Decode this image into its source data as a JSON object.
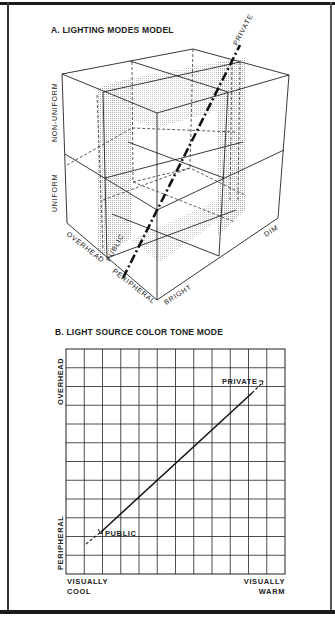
{
  "panel_a": {
    "title": "A. LIGHTING MODES MODEL",
    "axis_labels": {
      "vertical_upper": "NON-UNIFORM",
      "vertical_lower": "UNIFORM",
      "left_depth_back": "OVERHEAD",
      "left_depth_front": "PERIPHERAL",
      "right_near": "BRIGHT",
      "right_far": "DIM"
    },
    "trajectory": {
      "start_label": "PUBLIC",
      "end_label": "PRIVATE"
    }
  },
  "panel_b": {
    "title": "B. LIGHT SOURCE COLOR TONE MODE",
    "y_label_top": "OVERHEAD",
    "y_label_bottom": "PERIPHERAL",
    "x_label_left_1": "VISUALLY",
    "x_label_left_2": "COOL",
    "x_label_right_1": "VISUALLY",
    "x_label_right_2": "WARM",
    "point_start_label": "PUBLIC",
    "point_end_label": "PRIVATE"
  },
  "chart_data": [
    {
      "type": "diagram",
      "title": "A. LIGHTING MODES MODEL",
      "description": "3D isometric 2x2x2 cube model; axes: Uniform/Non-uniform (vertical), Overhead/Peripheral (left depth), Bright/Dim (right depth). Dash-dot trajectory from PUBLIC (bottom, bright/peripheral side) to PRIVATE (top, non-uniform/dim/overhead).",
      "axes": {
        "vertical": [
          "UNIFORM",
          "NON-UNIFORM"
        ],
        "left": [
          "PERIPHERAL",
          "OVERHEAD"
        ],
        "right": [
          "BRIGHT",
          "DIM"
        ]
      },
      "annotations": [
        "PUBLIC",
        "PRIVATE"
      ]
    },
    {
      "type": "line",
      "title": "B. LIGHT SOURCE COLOR TONE MODE",
      "xlabel": "VISUALLY COOL → VISUALLY WARM",
      "ylabel": "PERIPHERAL → OVERHEAD",
      "grid": true,
      "grid_columns": 12,
      "grid_rows": 12,
      "xlim": [
        0,
        12
      ],
      "ylim": [
        0,
        12
      ],
      "series": [
        {
          "name": "solid",
          "x": [
            1.9,
            10.2
          ],
          "y": [
            2.2,
            9.6
          ]
        },
        {
          "name": "dashed-extension-low",
          "x": [
            1.1,
            1.9
          ],
          "y": [
            1.6,
            2.2
          ]
        },
        {
          "name": "dashed-extension-high",
          "x": [
            10.2,
            10.7
          ],
          "y": [
            9.6,
            10.2
          ]
        }
      ],
      "annotations": [
        {
          "text": "PUBLIC",
          "x": 1.9,
          "y": 2.2
        },
        {
          "text": "PRIVATE",
          "x": 10.7,
          "y": 10.2
        }
      ]
    }
  ]
}
